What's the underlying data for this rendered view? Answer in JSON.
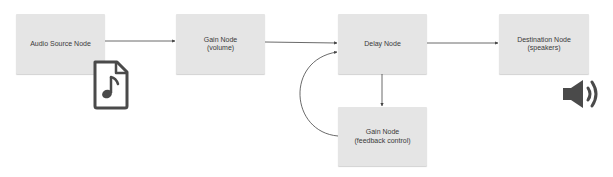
{
  "diagram": {
    "nodes": [
      {
        "id": "audio-source",
        "label_line1": "Audio Source Node",
        "label_line2": ""
      },
      {
        "id": "gain-volume",
        "label_line1": "Gain Node",
        "label_line2": "(volume)"
      },
      {
        "id": "delay",
        "label_line1": "Delay Node",
        "label_line2": ""
      },
      {
        "id": "destination",
        "label_line1": "Destination Node",
        "label_line2": "(speakers)"
      },
      {
        "id": "gain-feedback",
        "label_line1": "Gain Node",
        "label_line2": "(feedback control)"
      }
    ],
    "edges": [
      {
        "from": "audio-source",
        "to": "gain-volume"
      },
      {
        "from": "gain-volume",
        "to": "delay"
      },
      {
        "from": "delay",
        "to": "destination"
      },
      {
        "from": "delay",
        "to": "gain-feedback"
      },
      {
        "from": "gain-feedback",
        "to": "delay"
      }
    ],
    "icons": {
      "source_icon": "audio-file-icon",
      "destination_icon": "speaker-icon"
    },
    "colors": {
      "node_fill": "#e5e5e5",
      "text": "#3a3a3a",
      "edge": "#444444",
      "icon": "#4a4a4a"
    }
  }
}
